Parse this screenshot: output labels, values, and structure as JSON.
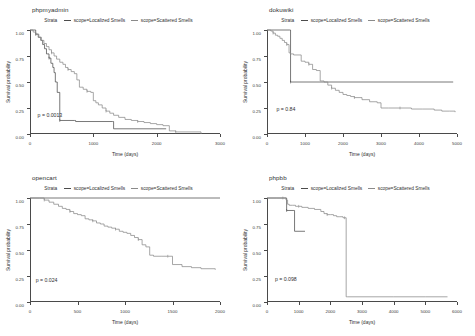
{
  "figure": {
    "width": 475,
    "height": 336,
    "background": "#ffffff",
    "axis_title_x": "Time (days)",
    "axis_title_y": "Survival probability",
    "legend_title": "Strata",
    "strata": [
      {
        "label": "scope=Localized Smells",
        "color": "#4c4c4c"
      },
      {
        "label": "scope=Scattered Smells",
        "color": "#8a8a8a"
      }
    ]
  },
  "chart_data": [
    {
      "type": "line",
      "title": "phpmyadmin",
      "xlabel": "Time (days)",
      "ylabel": "Survival probability",
      "xlim": [
        0,
        3000
      ],
      "ylim": [
        0,
        1
      ],
      "xticks": [
        0,
        1000,
        2000,
        3000
      ],
      "xticklabels": [
        "0",
        "1000",
        "2000",
        "3000"
      ],
      "yticks": [
        0,
        0.25,
        0.5,
        0.75,
        1
      ],
      "yticklabels": [
        "0.00",
        "0.25",
        "0.50",
        "0.75",
        "1.00"
      ],
      "grid": false,
      "legend_position": "top-center",
      "annotation": "p = 0.0013",
      "annotation_xy": [
        120,
        0.17
      ],
      "series": [
        {
          "name": "scope=Localized Smells",
          "x": [
            0,
            60,
            90,
            130,
            170,
            200,
            230,
            260,
            300,
            330,
            360,
            380,
            400,
            430,
            470,
            700,
            720,
            1300,
            1320,
            2150
          ],
          "y": [
            1.0,
            1.0,
            0.96,
            0.93,
            0.9,
            0.86,
            0.82,
            0.77,
            0.73,
            0.68,
            0.64,
            0.59,
            0.5,
            0.4,
            0.13,
            0.13,
            0.12,
            0.12,
            0.05,
            0.05
          ]
        },
        {
          "name": "scope=Scattered Smells",
          "x": [
            0,
            50,
            90,
            140,
            180,
            220,
            260,
            300,
            340,
            380,
            420,
            470,
            520,
            560,
            600,
            650,
            700,
            740,
            780,
            840,
            900,
            960,
            1000,
            1040,
            1080,
            1140,
            1200,
            1260,
            1320,
            1400,
            1500,
            1600,
            1700,
            1800,
            1900,
            2000,
            2100,
            2200,
            2300,
            2700
          ],
          "y": [
            1.0,
            0.98,
            0.96,
            0.93,
            0.9,
            0.87,
            0.84,
            0.81,
            0.78,
            0.75,
            0.72,
            0.69,
            0.67,
            0.64,
            0.62,
            0.6,
            0.58,
            0.52,
            0.45,
            0.43,
            0.41,
            0.4,
            0.32,
            0.3,
            0.28,
            0.25,
            0.22,
            0.2,
            0.18,
            0.16,
            0.14,
            0.13,
            0.12,
            0.11,
            0.1,
            0.09,
            0.08,
            0.03,
            0.02,
            0.0
          ]
        }
      ]
    },
    {
      "type": "line",
      "title": "dokuwiki",
      "xlabel": "Time (days)",
      "ylabel": "Survival probability",
      "xlim": [
        0,
        5000
      ],
      "ylim": [
        0,
        1
      ],
      "xticks": [
        0,
        1000,
        2000,
        3000,
        4000,
        5000
      ],
      "xticklabels": [
        "0",
        "1000",
        "2000",
        "3000",
        "4000",
        "5000"
      ],
      "yticks": [
        0,
        0.25,
        0.5,
        0.75,
        1
      ],
      "yticklabels": [
        "0.00",
        "0.25",
        "0.50",
        "0.75",
        "1.00"
      ],
      "grid": false,
      "legend_position": "top-center",
      "annotation": "p = 0.84",
      "annotation_xy": [
        250,
        0.23
      ],
      "series": [
        {
          "name": "scope=Localized Smells",
          "x": [
            0,
            600,
            620,
            4900
          ],
          "y": [
            1.0,
            1.0,
            0.5,
            0.5
          ]
        },
        {
          "name": "scope=Scattered Smells",
          "x": [
            0,
            100,
            160,
            220,
            280,
            340,
            400,
            460,
            520,
            580,
            620,
            700,
            900,
            1000,
            1100,
            1200,
            1300,
            1400,
            1500,
            1600,
            1700,
            1800,
            1900,
            2000,
            2100,
            2200,
            2300,
            2500,
            2700,
            2900,
            3000,
            3200,
            3500,
            3800,
            4100,
            4400,
            4600,
            4800,
            4950
          ],
          "y": [
            1.0,
            0.99,
            0.97,
            0.95,
            0.94,
            0.92,
            0.9,
            0.88,
            0.86,
            0.78,
            0.77,
            0.76,
            0.7,
            0.69,
            0.67,
            0.62,
            0.61,
            0.51,
            0.5,
            0.47,
            0.44,
            0.42,
            0.4,
            0.38,
            0.37,
            0.36,
            0.35,
            0.33,
            0.31,
            0.3,
            0.25,
            0.25,
            0.25,
            0.24,
            0.24,
            0.23,
            0.22,
            0.22,
            0.21
          ]
        }
      ]
    },
    {
      "type": "line",
      "title": "opencart",
      "xlabel": "Time (days)",
      "ylabel": "Survival probability",
      "xlim": [
        0,
        2000
      ],
      "ylim": [
        0,
        1
      ],
      "xticks": [
        0,
        500,
        1000,
        1500,
        2000
      ],
      "xticklabels": [
        "0",
        "500",
        "1000",
        "1500",
        "2000"
      ],
      "yticks": [
        0,
        0.25,
        0.5,
        0.75,
        1
      ],
      "yticklabels": [
        "0.00",
        "0.25",
        "0.50",
        "0.75",
        "1.00"
      ],
      "grid": false,
      "legend_position": "top-center",
      "annotation": "p = 0.024",
      "annotation_xy": [
        60,
        0.2
      ],
      "series": [
        {
          "name": "scope=Localized Smells",
          "x": [
            0,
            2000
          ],
          "y": [
            1.0,
            1.0
          ]
        },
        {
          "name": "scope=Scattered Smells",
          "x": [
            0,
            100,
            150,
            200,
            250,
            300,
            340,
            380,
            420,
            460,
            500,
            540,
            580,
            620,
            660,
            700,
            740,
            780,
            820,
            860,
            900,
            940,
            980,
            1020,
            1060,
            1100,
            1140,
            1180,
            1220,
            1260,
            1300,
            1380,
            1450,
            1500,
            1600,
            1700,
            1800,
            1950
          ],
          "y": [
            1.0,
            1.0,
            0.98,
            0.96,
            0.94,
            0.92,
            0.9,
            0.89,
            0.87,
            0.85,
            0.84,
            0.83,
            0.8,
            0.79,
            0.78,
            0.76,
            0.75,
            0.73,
            0.72,
            0.71,
            0.7,
            0.68,
            0.67,
            0.66,
            0.64,
            0.62,
            0.6,
            0.55,
            0.53,
            0.45,
            0.44,
            0.44,
            0.44,
            0.36,
            0.34,
            0.33,
            0.32,
            0.31
          ]
        }
      ]
    },
    {
      "type": "line",
      "title": "phpbb",
      "xlabel": "Time (days)",
      "ylabel": "Survival probability",
      "xlim": [
        0,
        6000
      ],
      "ylim": [
        0,
        1
      ],
      "xticks": [
        0,
        1000,
        2000,
        3000,
        4000,
        5000,
        6000
      ],
      "xticklabels": [
        "0",
        "1000",
        "2000",
        "3000",
        "4000",
        "5000",
        "6000"
      ],
      "yticks": [
        0,
        0.25,
        0.5,
        0.75,
        1
      ],
      "yticklabels": [
        "0.00",
        "0.25",
        "0.50",
        "0.75",
        "1.00"
      ],
      "grid": false,
      "legend_position": "top-center",
      "annotation": "p = 0.098",
      "annotation_xy": [
        250,
        0.21
      ],
      "series": [
        {
          "name": "scope=Localized Smells",
          "x": [
            0,
            600,
            620,
            850,
            870,
            1200
          ],
          "y": [
            1.0,
            1.0,
            0.88,
            0.88,
            0.68,
            0.68
          ]
        },
        {
          "name": "scope=Scattered Smells",
          "x": [
            0,
            300,
            500,
            600,
            650,
            700,
            800,
            900,
            1000,
            1100,
            1300,
            1500,
            1700,
            1800,
            1900,
            2000,
            2100,
            2200,
            2300,
            2400,
            2450,
            2500,
            2550,
            3000,
            4000,
            5000,
            5700
          ],
          "y": [
            1.0,
            1.0,
            1.0,
            0.98,
            0.94,
            0.93,
            0.93,
            0.92,
            0.92,
            0.91,
            0.9,
            0.89,
            0.87,
            0.85,
            0.84,
            0.84,
            0.83,
            0.82,
            0.82,
            0.81,
            0.81,
            0.05,
            0.05,
            0.05,
            0.05,
            0.05,
            0.05
          ]
        }
      ]
    }
  ]
}
